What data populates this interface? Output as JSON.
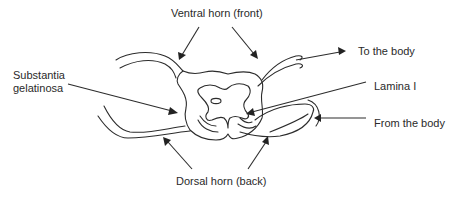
{
  "diagram": {
    "labels": {
      "ventral_horn": "Ventral horn (front)",
      "to_the_body": "To the body",
      "substantia_gelatinosa_line1": "Substantia",
      "substantia_gelatinosa_line2": "gelatinosa",
      "lamina_i": "Lamina I",
      "from_the_body": "From the body",
      "dorsal_horn": "Dorsal horn (back)"
    },
    "colors": {
      "line": "#2c2c2c",
      "text": "#2a2a2a",
      "background": "#ffffff"
    }
  }
}
